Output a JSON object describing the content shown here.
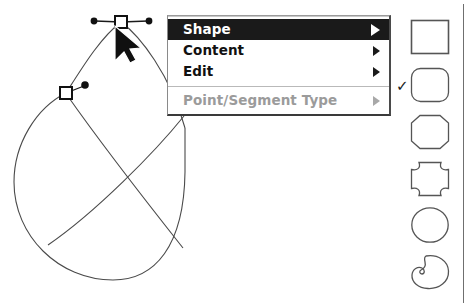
{
  "app": {
    "title": "Vector Shape Editor",
    "background_color": "#ffffff"
  },
  "canvas": {
    "name": "vector-drawing-canvas",
    "description": "Bezier path editing canvas showing a circle with two crossing chord segments",
    "stroke_color": "#3a3a3a",
    "anchor_fill": "#ffffff",
    "anchor_stroke": "#1a1a1a",
    "handle_color": "#1a1a1a",
    "cursor": "arrow-pointer",
    "anchors": [
      {
        "name": "anchor-top",
        "x": 121,
        "y": 22,
        "selected": true
      },
      {
        "name": "anchor-left",
        "x": 66,
        "y": 93,
        "selected": true
      }
    ],
    "control_handles": [
      {
        "name": "handle-top-left",
        "x": 94,
        "y": 21
      },
      {
        "name": "handle-top-right",
        "x": 149,
        "y": 21
      },
      {
        "name": "handle-left",
        "x": 84,
        "y": 85
      }
    ]
  },
  "context_menu": {
    "name": "shape-context-menu",
    "items": [
      {
        "label": "Shape",
        "has_submenu": true,
        "highlighted": true,
        "disabled": false
      },
      {
        "label": "Content",
        "has_submenu": true,
        "highlighted": false,
        "disabled": false
      },
      {
        "label": "Edit",
        "has_submenu": true,
        "highlighted": false,
        "disabled": false
      }
    ],
    "separator_after": 3,
    "secondary_items": [
      {
        "label": "Point/Segment Type",
        "has_submenu": true,
        "highlighted": false,
        "disabled": true
      }
    ],
    "highlight_color": "#1a1a1a",
    "disabled_color": "#9b9b9b"
  },
  "shape_palette": {
    "name": "shape-style-palette",
    "selected_index": 1,
    "check_mark": "✓",
    "swatches": [
      {
        "name": "swatch-rectangle",
        "shape": "rectangle",
        "top": 19,
        "selected": false
      },
      {
        "name": "swatch-rounded-rectangle",
        "shape": "rounded-rectangle",
        "top": 67,
        "selected": true
      },
      {
        "name": "swatch-octagon",
        "shape": "octagon",
        "top": 114,
        "selected": false
      },
      {
        "name": "swatch-concave-square",
        "shape": "concave-square",
        "top": 161,
        "selected": false
      },
      {
        "name": "swatch-circle",
        "shape": "circle",
        "top": 206,
        "selected": false
      },
      {
        "name": "swatch-blob",
        "shape": "blob",
        "top": 253,
        "selected": false
      }
    ]
  }
}
